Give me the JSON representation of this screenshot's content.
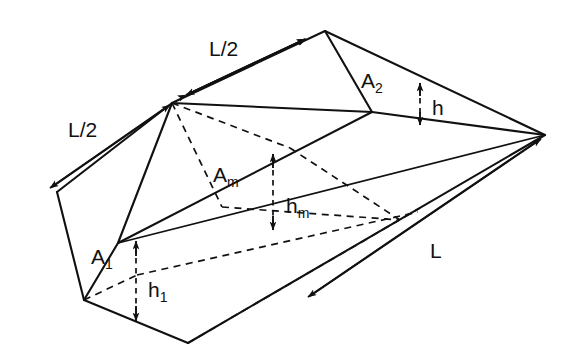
{
  "figure": {
    "background_color": "#ffffff",
    "line_color": "#111111"
  },
  "labels": {
    "length_half_top": "L/2",
    "length_half_left": "L/2",
    "length_full": "L",
    "area_near": "A",
    "area_near_sub": "1",
    "area_far": "A",
    "area_far_sub": "2",
    "area_mid": "A",
    "area_mid_sub": "m",
    "depth_near": "h",
    "depth_near_sub": "1",
    "depth_far": "h",
    "depth_far_sub": "",
    "depth_mid": "h",
    "depth_mid_sub": "m"
  },
  "dimensions": {
    "image_width": 586,
    "image_height": 359
  },
  "geometry": {
    "top_apex": [
      325,
      31
    ],
    "mid_top_break": [
      172,
      103
    ],
    "left_vertex": [
      57,
      192
    ],
    "right_vertex": [
      545,
      135
    ],
    "bottom_vertex": [
      188,
      343
    ],
    "a2_bottom": [
      372,
      112
    ],
    "a1_bottom": [
      84,
      300
    ],
    "am_top": [
      172,
      103
    ],
    "am_bottom": [
      222,
      207
    ]
  }
}
